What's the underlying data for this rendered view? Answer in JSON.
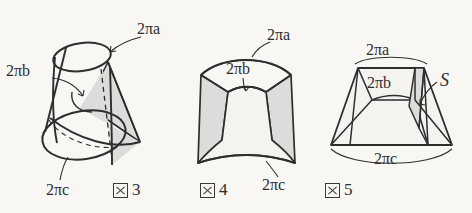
{
  "page": {
    "background_color": "#f8f7f4",
    "ink_color": "#2e2e2e",
    "shade_color": "#dcdcda"
  },
  "figures": [
    {
      "id": "figure-3",
      "caption_mark": "図",
      "caption_number": "3",
      "caption_full": "図 3",
      "shape": "oblique-cone-with-cylinder",
      "labels": [
        {
          "name": "label-2pia",
          "text": "2πa",
          "pi": "π",
          "coefficient": "2",
          "variable": "a"
        },
        {
          "name": "label-2pib",
          "text": "2πb",
          "pi": "π",
          "coefficient": "2",
          "variable": "b"
        },
        {
          "name": "label-2pic",
          "text": "2πc",
          "pi": "π",
          "coefficient": "2",
          "variable": "c"
        }
      ]
    },
    {
      "id": "figure-4",
      "caption_mark": "図",
      "caption_number": "4",
      "caption_full": "図 4",
      "shape": "curved-frustum-band",
      "labels": [
        {
          "name": "label-2pia",
          "text": "2πa",
          "pi": "π",
          "coefficient": "2",
          "variable": "a"
        },
        {
          "name": "label-2pib",
          "text": "2πb",
          "pi": "π",
          "coefficient": "2",
          "variable": "b"
        },
        {
          "name": "label-2pic",
          "text": "2πc",
          "pi": "π",
          "coefficient": "2",
          "variable": "c"
        }
      ]
    },
    {
      "id": "figure-5",
      "caption_mark": "図",
      "caption_number": "5",
      "caption_full": "図 5",
      "shape": "flattened-trapezoid-frustum",
      "labels": [
        {
          "name": "label-2pia",
          "text": "2πa",
          "pi": "π",
          "coefficient": "2",
          "variable": "a"
        },
        {
          "name": "label-2pib",
          "text": "2πb",
          "pi": "π",
          "coefficient": "2",
          "variable": "b"
        },
        {
          "name": "label-2pic",
          "text": "2πc",
          "pi": "π",
          "coefficient": "2",
          "variable": "c"
        },
        {
          "name": "label-s",
          "text": "S",
          "variable": "S"
        }
      ]
    }
  ],
  "fig3": {
    "label_a": "2πa",
    "label_b": "2πb",
    "label_c": "2πc",
    "caption_number": "3"
  },
  "fig4": {
    "label_a": "2πa",
    "label_b": "2πb",
    "label_c": "2πc",
    "caption_number": "4"
  },
  "fig5": {
    "label_a": "2πa",
    "label_b": "2πb",
    "label_c": "2πc",
    "label_s": "S",
    "caption_number": "5"
  }
}
